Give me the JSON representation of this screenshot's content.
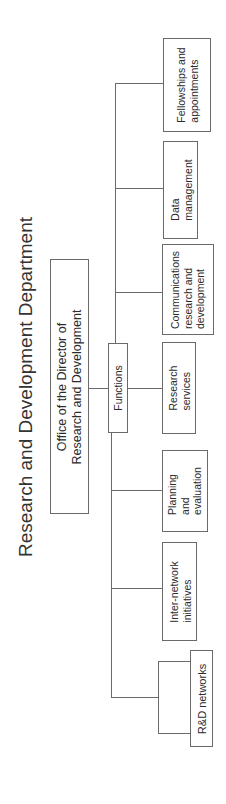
{
  "title": "Research and Development Department",
  "root": {
    "label_line1": "Office of the Director of",
    "label_line2": "Research and Development"
  },
  "functions": {
    "label": "Functions"
  },
  "units": [
    {
      "id": "rd-networks",
      "lines": [
        "R&D networks"
      ]
    },
    {
      "id": "inter-network-initiatives",
      "lines": [
        "Inter-network",
        "initiatives"
      ]
    },
    {
      "id": "planning-evaluation",
      "lines": [
        "Planning",
        "and",
        "evaluation"
      ]
    },
    {
      "id": "research-services",
      "lines": [
        "Research",
        "services"
      ]
    },
    {
      "id": "communications-rd",
      "lines": [
        "Communications",
        "research and",
        "development"
      ]
    },
    {
      "id": "data-management",
      "lines": [
        "Data",
        "management"
      ]
    },
    {
      "id": "fellowships-appointments",
      "lines": [
        "Fellowships and",
        "appointments"
      ]
    }
  ],
  "colors": {
    "line": "#6a6a6a",
    "text": "#2b2b2b",
    "background": "#ffffff"
  }
}
